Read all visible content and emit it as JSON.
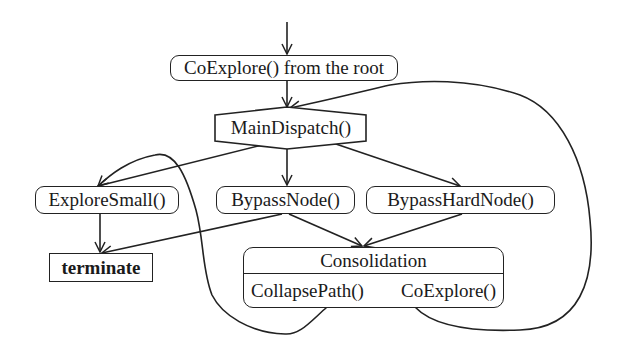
{
  "diagram": {
    "type": "flowchart",
    "nodes": {
      "root": {
        "label": "CoExplore() from the root",
        "shape": "rounded-rect"
      },
      "dispatch": {
        "label": "MainDispatch()",
        "shape": "hexagon"
      },
      "explore_small": {
        "label": "ExploreSmall()",
        "shape": "rounded-rect"
      },
      "bypass_node": {
        "label": "BypassNode()",
        "shape": "rounded-rect"
      },
      "bypass_hard_node": {
        "label": "BypassHardNode()",
        "shape": "rounded-rect"
      },
      "terminate": {
        "label": "terminate",
        "shape": "rect-bold"
      },
      "consolidation": {
        "label": "Consolidation",
        "shape": "compartment-box",
        "operations": [
          "CollapsePath()",
          "CoExplore()"
        ]
      }
    },
    "edges": [
      {
        "from": "entry",
        "to": "root"
      },
      {
        "from": "root",
        "to": "dispatch"
      },
      {
        "from": "dispatch",
        "to": "explore_small"
      },
      {
        "from": "dispatch",
        "to": "bypass_node"
      },
      {
        "from": "dispatch",
        "to": "bypass_hard_node"
      },
      {
        "from": "explore_small",
        "to": "terminate"
      },
      {
        "from": "bypass_node",
        "to": "terminate"
      },
      {
        "from": "bypass_node",
        "to": "consolidation"
      },
      {
        "from": "bypass_hard_node",
        "to": "consolidation"
      },
      {
        "from": "consolidation",
        "to": "explore_small",
        "style": "curved-loop"
      },
      {
        "from": "consolidation",
        "to": "dispatch",
        "style": "curved-loop"
      }
    ],
    "colors": {
      "stroke": "#222222",
      "background": "#ffffff",
      "text": "#1a1a1a"
    }
  }
}
